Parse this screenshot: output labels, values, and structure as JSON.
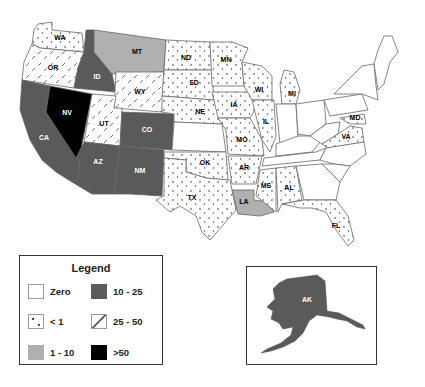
{
  "legend": {
    "title": "Legend",
    "items": [
      {
        "label": "Zero",
        "pattern": "none",
        "color": "#ffffff"
      },
      {
        "label": "< 1",
        "pattern": "dots",
        "color": "#ffffff"
      },
      {
        "label": "1 - 10",
        "pattern": "solid",
        "color": "#b0b0b0"
      },
      {
        "label": "10 - 25",
        "pattern": "solid",
        "color": "#5a5a5a"
      },
      {
        "label": "25 - 50",
        "pattern": "dashes",
        "color": "#ffffff"
      },
      {
        "label": ">50",
        "pattern": "solid",
        "color": "#000000"
      }
    ]
  },
  "states": {
    "WA": {
      "label": "WA",
      "category": "< 1"
    },
    "OR": {
      "label": "OR",
      "category": "25 - 50"
    },
    "CA": {
      "label": "CA",
      "category": "10 - 25"
    },
    "NV": {
      "label": "NV",
      "category": "> 50"
    },
    "ID": {
      "label": "ID",
      "category": "10 - 25"
    },
    "MT": {
      "label": "MT",
      "category": "1 - 10"
    },
    "WY": {
      "label": "WY",
      "category": "25 - 50"
    },
    "UT": {
      "label": "UT",
      "category": "25 - 50"
    },
    "AZ": {
      "label": "AZ",
      "category": "10 - 25"
    },
    "CO": {
      "label": "CO",
      "category": "10 - 25"
    },
    "NM": {
      "label": "NM",
      "category": "10 - 25"
    },
    "ND": {
      "label": "ND",
      "category": "< 1"
    },
    "SD": {
      "label": "SD",
      "category": "< 1"
    },
    "NE": {
      "label": "NE",
      "category": "< 1"
    },
    "KS": {
      "label": "",
      "category": "Zero"
    },
    "OK": {
      "label": "OK",
      "category": "< 1"
    },
    "TX": {
      "label": "TX",
      "category": "< 1"
    },
    "MN": {
      "label": "MN",
      "category": "< 1"
    },
    "IA": {
      "label": "IA",
      "category": "< 1"
    },
    "MO": {
      "label": "MO",
      "category": "< 1"
    },
    "AR": {
      "label": "AR",
      "category": "< 1"
    },
    "LA": {
      "label": "LA",
      "category": "1 - 10"
    },
    "WI": {
      "label": "WI",
      "category": "< 1"
    },
    "IL": {
      "label": "IL",
      "category": "< 1"
    },
    "MI": {
      "label": "MI",
      "category": "< 1"
    },
    "MS": {
      "label": "MS",
      "category": "< 1"
    },
    "AL": {
      "label": "AL",
      "category": "< 1"
    },
    "FL": {
      "label": "FL",
      "category": "< 1"
    },
    "MD": {
      "label": "MD",
      "category": "< 1"
    },
    "VA": {
      "label": "VA",
      "category": "< 1"
    },
    "AK": {
      "label": "AK",
      "category": "10 - 25"
    }
  }
}
